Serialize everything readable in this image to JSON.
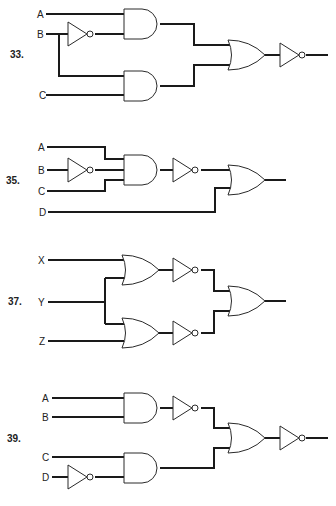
{
  "problems": [
    {
      "number": "33.",
      "inputs": [
        "A",
        "B",
        "C"
      ],
      "gates": [
        "NOT(B)",
        "AND(A, NOT B)",
        "AND(B, C)",
        "OR",
        "NOT"
      ],
      "expression": "NOT( (A AND NOT B) OR (B AND C) )"
    },
    {
      "number": "35.",
      "inputs": [
        "A",
        "B",
        "C",
        "D"
      ],
      "gates": [
        "NOT(B)",
        "AND(A, NOT B, C)",
        "NOT",
        "OR"
      ],
      "expression": "NOT(A AND NOT B AND C) OR D"
    },
    {
      "number": "37.",
      "inputs": [
        "X",
        "Y",
        "Z"
      ],
      "gates": [
        "OR(X, Y)",
        "OR(Y, Z)",
        "NOT",
        "NOT",
        "OR"
      ],
      "expression": "NOT(X OR Y) OR NOT(Y OR Z)"
    },
    {
      "number": "39.",
      "inputs": [
        "A",
        "B",
        "C",
        "D"
      ],
      "gates": [
        "AND(A, B)",
        "NOT",
        "NOT(D)",
        "AND(C, NOT D)",
        "OR",
        "NOT"
      ],
      "expression": "NOT( NOT(A AND B) OR (C AND NOT D) )"
    }
  ],
  "colors": {
    "ink": "#1a1a1a",
    "background": "#ffffff"
  }
}
